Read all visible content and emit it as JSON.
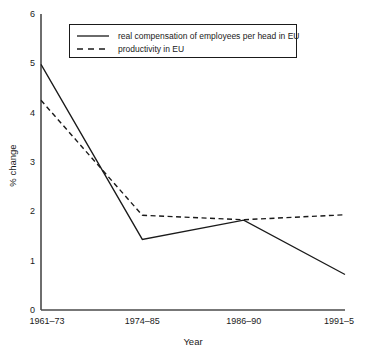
{
  "chart_data": {
    "type": "line",
    "title": "",
    "xlabel": "Year",
    "ylabel": "% change",
    "categories": [
      "1961–73",
      "1974–85",
      "1986–90",
      "1991–5"
    ],
    "ylim": [
      0,
      6
    ],
    "yticks": [
      0,
      1,
      2,
      3,
      4,
      5,
      6
    ],
    "ytick_labels": [
      "0",
      "1",
      "2",
      "3",
      "4",
      "5",
      "6"
    ],
    "grid": false,
    "legend_position": "top-center",
    "series": [
      {
        "name": "real compensation of employees per head in EU",
        "style": "solid",
        "color": "#1a1a1a",
        "values": [
          4.98,
          1.43,
          1.82,
          0.72
        ]
      },
      {
        "name": "productivity in EU",
        "style": "dashed",
        "color": "#1a1a1a",
        "values": [
          4.25,
          1.92,
          1.83,
          1.93
        ]
      }
    ]
  },
  "axis": {
    "y_title": "% change",
    "x_title": "Year"
  },
  "legend": {
    "items": [
      {
        "label": "real compensation of employees per head in EU",
        "style": "solid"
      },
      {
        "label": "productivity in EU",
        "style": "dashed"
      }
    ]
  }
}
